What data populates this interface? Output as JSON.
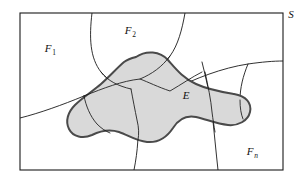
{
  "figure": {
    "kind": "set-partition-venn-diagram",
    "background_color": "#ffffff",
    "frame": {
      "label": "S",
      "label_x": 291,
      "label_y": 18,
      "x": 20,
      "y": 13,
      "width": 263,
      "height": 157,
      "stroke_color": "#1a1a1a",
      "stroke_width": 1.1,
      "fill_color": "#ffffff"
    },
    "partition_lines": {
      "stroke_color": "#1a1a1a",
      "stroke_width": 0.9,
      "fill": "none"
    },
    "event": {
      "label": "E",
      "label_x": 186,
      "label_y": 99,
      "fill_color": "#d9d9d9",
      "stroke_color": "#4a4a4a",
      "stroke_width": 2.0
    },
    "labels": [
      {
        "name": "label-F1",
        "base": "F",
        "sub": "1",
        "sub_italic": false,
        "x": 48,
        "y": 52
      },
      {
        "name": "label-F2",
        "base": "F",
        "sub": "2",
        "sub_italic": false,
        "x": 128,
        "y": 34
      },
      {
        "name": "label-E",
        "base": "E",
        "sub": "",
        "sub_italic": false,
        "x": 186,
        "y": 99
      },
      {
        "name": "label-Fn",
        "base": "F",
        "sub": "n",
        "sub_italic": true,
        "x": 250,
        "y": 155
      },
      {
        "name": "label-S",
        "base": "S",
        "sub": "",
        "sub_italic": false,
        "x": 291,
        "y": 18
      }
    ]
  }
}
